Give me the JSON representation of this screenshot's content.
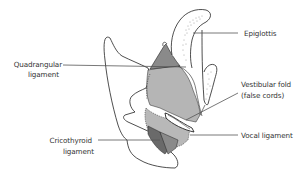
{
  "diagram": {
    "labels": {
      "epiglottis": "Epiglottis",
      "quadrangular_line1": "Quadrangular",
      "quadrangular_line2": "ligament",
      "vestibular_line1": "Vestibular fold",
      "vestibular_line2": "(false cords)",
      "vocal": "Vocal ligament",
      "cricothyroid_line1": "Cricothyroid",
      "cricothyroid_line2": "ligament"
    },
    "colors": {
      "outline": "#222222",
      "light_gray": "#b5b5b5",
      "mid_gray": "#8a8a8a",
      "dark_gray": "#6a6a6a",
      "leader_line": "#555555",
      "text": "#333333"
    }
  }
}
